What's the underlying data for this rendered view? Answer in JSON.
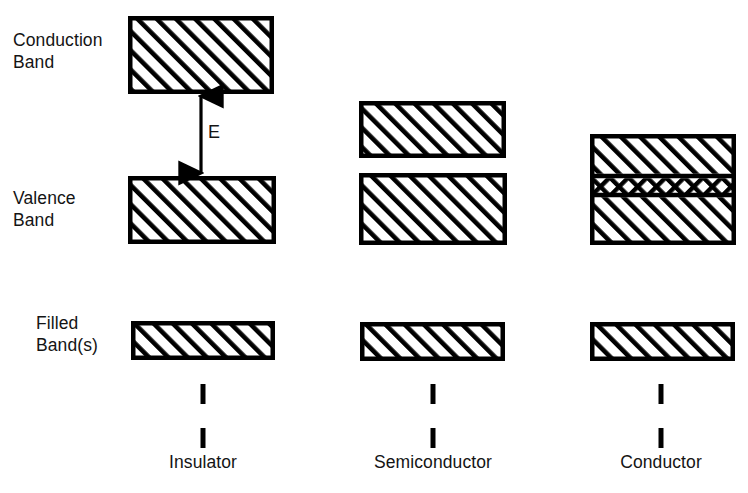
{
  "figure": {
    "background_color": "#ffffff",
    "ink_color": "#000000"
  },
  "row_labels": [
    {
      "id": "conduction-band",
      "text": "Conduction\nBand",
      "x": 13,
      "y": 30
    },
    {
      "id": "valence-band",
      "text": "Valence\nBand",
      "x": 13,
      "y": 188
    },
    {
      "id": "filled-bands",
      "text": "Filled\nBand(s)",
      "x": 36,
      "y": 313
    }
  ],
  "gap_annotation": {
    "id": "energy-gap",
    "label": "E",
    "label_x": 208,
    "label_y": 122,
    "arrow_x": 201,
    "arrow_top": 95,
    "arrow_bottom": 174
  },
  "columns": [
    {
      "id": "insulator",
      "label": "Insulator",
      "label_x": 203,
      "label_y": 452,
      "leader_x": 203,
      "leader_dashes": [
        {
          "y": 384,
          "height": 20
        },
        {
          "y": 428,
          "height": 20
        }
      ],
      "boxes": [
        {
          "id": "insulator-conduction-band",
          "role": "conduction-band",
          "x": 128,
          "y": 16,
          "width": 146,
          "height": 78,
          "fill": "hatch"
        },
        {
          "id": "insulator-valence-band",
          "role": "valence-band",
          "x": 128,
          "y": 176,
          "width": 148,
          "height": 68,
          "fill": "hatch"
        },
        {
          "id": "insulator-filled-band",
          "role": "filled-band",
          "x": 131,
          "y": 321,
          "width": 144,
          "height": 39,
          "fill": "hatch"
        }
      ]
    },
    {
      "id": "semiconductor",
      "label": "Semiconductor",
      "label_x": 433,
      "label_y": 452,
      "leader_x": 433,
      "leader_dashes": [
        {
          "y": 384,
          "height": 20
        },
        {
          "y": 428,
          "height": 20
        }
      ],
      "boxes": [
        {
          "id": "semiconductor-conduction-band",
          "role": "conduction-band",
          "x": 359,
          "y": 101,
          "width": 147,
          "height": 57,
          "fill": "hatch"
        },
        {
          "id": "semiconductor-valence-band",
          "role": "valence-band",
          "x": 359,
          "y": 173,
          "width": 148,
          "height": 72,
          "fill": "hatch"
        },
        {
          "id": "semiconductor-filled-band",
          "role": "filled-band",
          "x": 360,
          "y": 322,
          "width": 145,
          "height": 39,
          "fill": "hatch"
        }
      ]
    },
    {
      "id": "conductor",
      "label": "Conductor",
      "label_x": 661,
      "label_y": 452,
      "leader_x": 661,
      "leader_dashes": [
        {
          "y": 384,
          "height": 20
        },
        {
          "y": 428,
          "height": 20
        }
      ],
      "boxes": [
        {
          "id": "conductor-overlapping-bands",
          "role": "overlapping-bands",
          "x": 590,
          "y": 134,
          "width": 146,
          "height": 111,
          "fill": "stacked",
          "stripes": [
            {
              "id": "conductor-upper-band",
              "offset": 0,
              "height": 42,
              "fill": "hatch"
            },
            {
              "id": "conductor-overlap-band",
              "offset": 42,
              "height": 19,
              "fill": "crosshatch"
            },
            {
              "id": "conductor-lower-band",
              "offset": 61,
              "height": 50,
              "fill": "hatch"
            }
          ]
        },
        {
          "id": "conductor-filled-band",
          "role": "filled-band",
          "x": 590,
          "y": 322,
          "width": 145,
          "height": 39,
          "fill": "hatch"
        }
      ]
    }
  ]
}
